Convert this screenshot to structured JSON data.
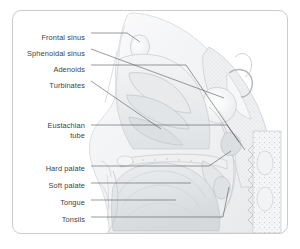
{
  "figure": {
    "type": "anatomical-diagram",
    "border_color": "#c9cbcd",
    "background_color": "#ffffff",
    "label_color": "#3c3f42",
    "leader_color": "#55585b",
    "tissue_light": "#f2f3f4",
    "tissue_mid": "#e4e6e8",
    "tissue_dark": "#d3d6d9",
    "outline_color": "#b9bcbf"
  },
  "labels": [
    {
      "id": "frontal-sinus",
      "text": "Frontal sinus",
      "x": 74,
      "y": 22,
      "lines": [
        "Frontal sinus"
      ]
    },
    {
      "id": "sphenoidal-sinus",
      "text": "Sphenoidal sinus",
      "x": 74,
      "y": 38,
      "lines": [
        "Sphenoidal sinus"
      ]
    },
    {
      "id": "adenoids",
      "text": "Adenoids",
      "x": 74,
      "y": 54,
      "lines": [
        "Adenoids"
      ]
    },
    {
      "id": "turbinates",
      "text": "Turbinates",
      "x": 74,
      "y": 70,
      "lines": [
        "Turbinates"
      ]
    },
    {
      "id": "eustachian-tube",
      "text": "Eustachian tube",
      "x": 74,
      "y": 110,
      "lines": [
        "Eustachian",
        "tube"
      ]
    },
    {
      "id": "hard-palate",
      "text": "Hard palate",
      "x": 74,
      "y": 153,
      "lines": [
        "Hard palate"
      ]
    },
    {
      "id": "soft-palate",
      "text": "Soft palate",
      "x": 74,
      "y": 170,
      "lines": [
        "Soft palate"
      ]
    },
    {
      "id": "tongue",
      "text": "Tongue",
      "x": 74,
      "y": 187,
      "lines": [
        "Tongue"
      ]
    },
    {
      "id": "tonsils",
      "text": "Tonsils",
      "x": 74,
      "y": 204,
      "lines": [
        "Tonsils"
      ]
    }
  ],
  "leaders": [
    {
      "id": "leader-frontal-sinus",
      "points": "78,22 114,22 127,31"
    },
    {
      "id": "leader-sphenoidal-sinus",
      "points": "78,38 211,87"
    },
    {
      "id": "leader-adenoids",
      "points": "78,54 173,54 226,131"
    },
    {
      "id": "leader-turbinates",
      "points": "78,70 148,118"
    },
    {
      "id": "leader-eustachian-tube",
      "points": "78,114 214,114 232,139"
    },
    {
      "id": "leader-hard-palate",
      "points": "78,155 196,155 218,140"
    },
    {
      "id": "leader-soft-palate",
      "points": "78,172 178,172"
    },
    {
      "id": "leader-tongue",
      "points": "78,189 163,189"
    },
    {
      "id": "leader-tonsils",
      "points": "78,206 210,206 216,176"
    }
  ]
}
